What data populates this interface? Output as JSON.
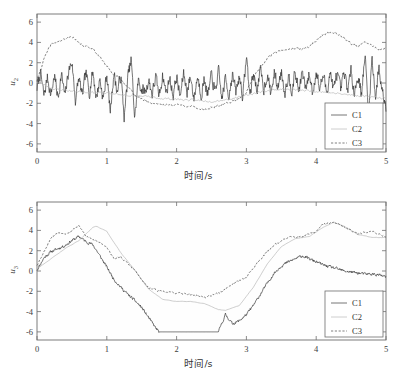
{
  "figure": {
    "background": "#ffffff",
    "panels": [
      "top",
      "bottom"
    ]
  },
  "colors": {
    "c1": "#2b2b2b",
    "c2": "#b4b4b4",
    "c3": "#3d3d3d",
    "axis": "#6e6e6e",
    "text": "#333333"
  },
  "top": {
    "ylabel_main": "u",
    "ylabel_sub": "2",
    "xlabel": "时间/s",
    "legend": {
      "c1": "C1",
      "c2": "C2",
      "c3": "C3"
    }
  },
  "bottom": {
    "ylabel_main": "u",
    "ylabel_sub": "3",
    "xlabel": "时间/s",
    "legend": {
      "c1": "C1",
      "c2": "C2",
      "c3": "C3"
    }
  },
  "chart_data": [
    {
      "type": "line",
      "panel": "top",
      "title": "",
      "xlabel": "时间/s",
      "ylabel": "u2",
      "xlim": [
        0,
        5
      ],
      "ylim": [
        -6.8,
        6.8
      ],
      "xticks": [
        0,
        1,
        2,
        3,
        4,
        5
      ],
      "xticklabels": [
        "0",
        "1",
        "2",
        "3",
        "4",
        "5"
      ],
      "yticks": [
        -6,
        -4,
        -2,
        0,
        2,
        4,
        6
      ],
      "yticklabels": [
        "-6",
        "-4",
        "-2",
        "0",
        "2",
        "4",
        "6"
      ],
      "grid": false,
      "legend_position": "lower right",
      "series": [
        {
          "name": "C1",
          "style": "solid",
          "color": "#2b2b2b",
          "description": "high-frequency noisy oscillation about 0, amplitude ~2, with transient spikes to +3 and -3.5",
          "x": [
            0,
            0.05,
            0.1,
            0.15,
            0.2,
            0.25,
            0.3,
            0.35,
            0.4,
            0.45,
            0.5,
            0.55,
            0.6,
            0.65,
            0.7,
            0.75,
            0.8,
            0.85,
            0.9,
            0.95,
            1,
            1.05,
            1.1,
            1.15,
            1.2,
            1.25,
            1.3,
            1.35,
            1.4,
            1.45,
            1.5,
            1.55,
            1.6,
            1.65,
            1.7,
            1.75,
            1.8,
            1.85,
            1.9,
            1.95,
            2,
            2.05,
            2.1,
            2.15,
            2.2,
            2.25,
            2.3,
            2.35,
            2.4,
            2.45,
            2.5,
            2.55,
            2.6,
            2.65,
            2.7,
            2.75,
            2.8,
            2.85,
            2.9,
            2.95,
            3,
            3.05,
            3.1,
            3.15,
            3.2,
            3.25,
            3.3,
            3.35,
            3.4,
            3.45,
            3.5,
            3.55,
            3.6,
            3.65,
            3.7,
            3.75,
            3.8,
            3.85,
            3.9,
            3.95,
            4,
            4.05,
            4.1,
            4.15,
            4.2,
            4.25,
            4.3,
            4.35,
            4.4,
            4.45,
            4.5,
            4.55,
            4.6,
            4.65,
            4.7,
            4.75,
            4.8,
            4.85,
            4.9,
            4.95,
            5
          ],
          "y": [
            -0.5,
            1.0,
            -1.3,
            0.6,
            -1.2,
            0.8,
            -1.5,
            0.9,
            -1.4,
            1.1,
            2.1,
            -1.7,
            0.5,
            -1.3,
            1.0,
            -0.9,
            1.2,
            -1.5,
            0.4,
            -1.6,
            0.9,
            -2.9,
            1.0,
            -0.9,
            0.8,
            -3.4,
            0.5,
            2.3,
            -3.5,
            0.2,
            -0.6,
            -0.9,
            0.3,
            -1.1,
            0.6,
            -1.3,
            0.8,
            -1.0,
            0.5,
            -1.2,
            0.7,
            -1.4,
            0.9,
            -0.8,
            0.6,
            -1.5,
            0.7,
            -1.1,
            0.4,
            -1.3,
            0.8,
            -0.9,
            1.1,
            -1.6,
            0.5,
            -1.2,
            0.9,
            -1.0,
            0.7,
            -1.4,
            2.7,
            -1.3,
            1.0,
            -0.7,
            1.2,
            -0.6,
            0.9,
            -1.1,
            1.0,
            -0.5,
            1.2,
            -0.9,
            0.8,
            -0.6,
            1.0,
            -0.8,
            1.1,
            -0.7,
            0.9,
            -1.0,
            1.2,
            -0.6,
            0.8,
            -0.9,
            1.1,
            -0.7,
            1.0,
            -0.8,
            0.9,
            -0.6,
            1.1,
            -0.9,
            0.7,
            -1.0,
            2.8,
            -3.2,
            2.6,
            -1.4,
            1.5,
            -0.9,
            -2.2
          ]
        },
        {
          "name": "C2",
          "style": "dotted",
          "color": "#b4b4b4",
          "description": "slow smooth drift near -1, mildly dipping to -1.8 mid-record, rising slightly near 3-4s",
          "x": [
            0,
            0.25,
            0.5,
            0.75,
            1,
            1.25,
            1.5,
            1.75,
            2,
            2.25,
            2.5,
            2.75,
            3,
            3.25,
            3.5,
            3.75,
            4,
            4.25,
            4.5,
            4.75,
            5
          ],
          "y": [
            0.1,
            -0.6,
            -0.8,
            -0.9,
            -1.0,
            -1.2,
            -1.3,
            -1.5,
            -1.6,
            -1.7,
            -1.8,
            -1.6,
            -1.2,
            -0.8,
            -0.6,
            -0.7,
            -0.8,
            -1.0,
            -1.2,
            -1.3,
            -1.5
          ]
        },
        {
          "name": "C3",
          "style": "dashed",
          "color": "#3d3d3d",
          "description": "smooth large-scale wave: rises to +4.3 near 0.4s, second crest ~3.6 at 0.75s, falls to -2.5 around 2.5s, rises to +5 near 4.2s, ends ~+3.5",
          "x": [
            0,
            0.1,
            0.2,
            0.3,
            0.4,
            0.5,
            0.6,
            0.7,
            0.8,
            0.9,
            1,
            1.1,
            1.2,
            1.3,
            1.4,
            1.5,
            1.6,
            1.7,
            1.8,
            1.9,
            2,
            2.1,
            2.2,
            2.3,
            2.4,
            2.5,
            2.6,
            2.7,
            2.8,
            2.9,
            3,
            3.1,
            3.2,
            3.3,
            3.4,
            3.5,
            3.6,
            3.7,
            3.8,
            3.9,
            4,
            4.1,
            4.2,
            4.3,
            4.4,
            4.5,
            4.6,
            4.7,
            4.8,
            4.9,
            5
          ],
          "y": [
            0.2,
            2.4,
            3.8,
            4.1,
            4.3,
            4.6,
            3.9,
            3.6,
            3.4,
            2.6,
            1.6,
            0.9,
            0.3,
            -0.3,
            -1.2,
            -1.6,
            -1.9,
            -2.0,
            -2.1,
            -2.2,
            -2.1,
            -2.2,
            -2.3,
            -2.5,
            -2.6,
            -2.4,
            -2.3,
            -2.0,
            -1.8,
            -1.5,
            -0.9,
            0.6,
            1.5,
            2.4,
            3.0,
            3.2,
            3.4,
            3.4,
            3.3,
            3.6,
            4.2,
            4.8,
            5.0,
            4.9,
            4.4,
            3.9,
            3.6,
            4.0,
            3.7,
            3.3,
            3.4
          ]
        }
      ]
    },
    {
      "type": "line",
      "panel": "bottom",
      "title": "",
      "xlabel": "时间/s",
      "ylabel": "u3",
      "xlim": [
        0,
        5
      ],
      "ylim": [
        -6.8,
        6.8
      ],
      "xticks": [
        0,
        1,
        2,
        3,
        4,
        5
      ],
      "xticklabels": [
        "0",
        "1",
        "2",
        "3",
        "4",
        "5"
      ],
      "yticks": [
        -6,
        -4,
        -2,
        0,
        2,
        4,
        6
      ],
      "yticklabels": [
        "-6",
        "-4",
        "-2",
        "0",
        "2",
        "4",
        "6"
      ],
      "grid": false,
      "legend_position": "lower right",
      "series": [
        {
          "name": "C1",
          "style": "solid",
          "color": "#2b2b2b",
          "description": "noisy trace rising to +3.4 at 0.6s, dropping steeply and clipping flat at -6 from 1.75s to 2.6s, then climbing back to about +1.5 at 3.8s and settling near -0.3",
          "x": [
            0,
            0.1,
            0.2,
            0.3,
            0.4,
            0.5,
            0.6,
            0.7,
            0.8,
            0.9,
            1,
            1.1,
            1.2,
            1.3,
            1.4,
            1.5,
            1.6,
            1.7,
            1.75,
            2,
            2.25,
            2.5,
            2.6,
            2.7,
            2.8,
            2.9,
            3,
            3.1,
            3.2,
            3.3,
            3.4,
            3.5,
            3.6,
            3.7,
            3.8,
            3.9,
            4,
            4.1,
            4.2,
            4.3,
            4.4,
            4.5,
            4.6,
            4.7,
            4.8,
            4.9,
            5
          ],
          "y": [
            0.1,
            1.3,
            1.9,
            2.2,
            2.5,
            3.0,
            3.4,
            2.9,
            2.6,
            1.5,
            0.4,
            -0.8,
            -1.6,
            -2.3,
            -2.9,
            -3.6,
            -4.6,
            -5.6,
            -6.0,
            -6.0,
            -6.0,
            -6.0,
            -6.0,
            -4.3,
            -5.2,
            -4.9,
            -4.3,
            -3.4,
            -2.3,
            -1.2,
            -0.2,
            0.5,
            0.9,
            1.2,
            1.5,
            1.2,
            0.9,
            0.6,
            0.4,
            0.2,
            0.0,
            -0.1,
            -0.2,
            -0.3,
            -0.3,
            -0.4,
            -0.6
          ]
        },
        {
          "name": "C2",
          "style": "dotted",
          "color": "#b4b4b4",
          "description": "smooth envelope peaking +4.4 around 0.85s, decaying to about -3.9 near 2.7s, rising to +4.8 at 4.25s and ending near +3.3",
          "x": [
            0,
            0.2,
            0.4,
            0.6,
            0.8,
            0.85,
            1,
            1.2,
            1.4,
            1.6,
            1.8,
            2,
            2.2,
            2.4,
            2.6,
            2.7,
            2.9,
            3.1,
            3.3,
            3.5,
            3.7,
            3.9,
            4.1,
            4.25,
            4.4,
            4.6,
            4.8,
            5
          ],
          "y": [
            0.2,
            1.2,
            2.2,
            3.0,
            4.3,
            4.4,
            3.9,
            1.8,
            0.1,
            -1.8,
            -2.8,
            -3.0,
            -3.0,
            -3.2,
            -3.8,
            -3.9,
            -3.4,
            -1.6,
            0.7,
            2.4,
            3.2,
            3.4,
            4.3,
            4.8,
            4.4,
            3.6,
            3.3,
            3.3
          ]
        },
        {
          "name": "C3",
          "style": "dashed",
          "color": "#3d3d3d",
          "description": "rises to +4.5 at 0.6s, drops to about -2.4 plateau 1.6-2.4s, climbs from 2.8s to a +4.8 crest near 4.25s, ends ~+3.4",
          "x": [
            0,
            0.1,
            0.2,
            0.3,
            0.4,
            0.5,
            0.6,
            0.7,
            0.8,
            0.9,
            1,
            1.1,
            1.2,
            1.3,
            1.4,
            1.5,
            1.6,
            1.8,
            2,
            2.2,
            2.4,
            2.6,
            2.8,
            3,
            3.2,
            3.4,
            3.6,
            3.8,
            4,
            4.1,
            4.25,
            4.4,
            4.6,
            4.8,
            5
          ],
          "y": [
            0.6,
            1.9,
            3.3,
            3.8,
            3.7,
            4.0,
            4.5,
            3.4,
            3.1,
            2.8,
            2.4,
            1.2,
            1.4,
            0.7,
            0.1,
            -0.9,
            -1.7,
            -2.0,
            -2.2,
            -2.3,
            -2.6,
            -2.2,
            -1.3,
            -0.6,
            1.2,
            2.6,
            3.3,
            3.4,
            3.9,
            4.6,
            4.8,
            4.3,
            3.7,
            3.9,
            3.4
          ]
        }
      ]
    }
  ]
}
